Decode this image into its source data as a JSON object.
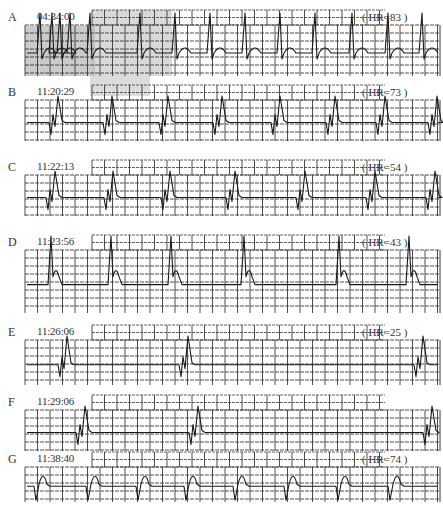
{
  "figure": {
    "caption": "",
    "strips": [
      {
        "label": "A",
        "time": "04:34:00",
        "hr": "( HR=83 )",
        "top": 8,
        "shaded": true,
        "beats": [
          40,
          52,
          60,
          70,
          90,
          140,
          175,
          210,
          245,
          280,
          315,
          352,
          388,
          422
        ],
        "morph": "narrow"
      },
      {
        "label": "B",
        "time": "11:20:29",
        "hr": "( HR=73 )",
        "top": 83,
        "shaded": false,
        "beats": [
          53,
          107,
          163,
          217,
          275,
          330,
          380,
          432
        ],
        "morph": "wide"
      },
      {
        "label": "C",
        "time": "11:22:13",
        "hr": "( HR=54 )",
        "top": 158,
        "shaded": false,
        "beats": [
          50,
          108,
          165,
          230,
          300,
          370,
          430
        ],
        "morph": "wide"
      },
      {
        "label": "D",
        "time": "11:23:56",
        "hr": "( HR=43 )",
        "top": 233,
        "shaded": false,
        "beats": [
          52,
          112,
          172,
          245,
          340,
          410
        ],
        "morph": "slur"
      },
      {
        "label": "E",
        "time": "11:26:06",
        "hr": "( HR=25 )",
        "top": 323,
        "shaded": false,
        "beats": [
          62,
          183,
          418
        ],
        "morph": "wide"
      },
      {
        "label": "F",
        "time": "11:29:06",
        "hr": "",
        "top": 393,
        "shaded": false,
        "beats": [
          80,
          193,
          427
        ],
        "morph": "wide"
      },
      {
        "label": "G",
        "time": "11:38:40",
        "hr": "( HR=74 )",
        "top": 450,
        "shaded": false,
        "beats": [
          38,
          90,
          140,
          188,
          237,
          288,
          340,
          392
        ],
        "morph": "inverted"
      }
    ]
  },
  "colors": {
    "grid": "#3a3a3a",
    "trace": "#1a1a1a",
    "shade": "#b9b9b9",
    "paper": "#ffffff"
  }
}
